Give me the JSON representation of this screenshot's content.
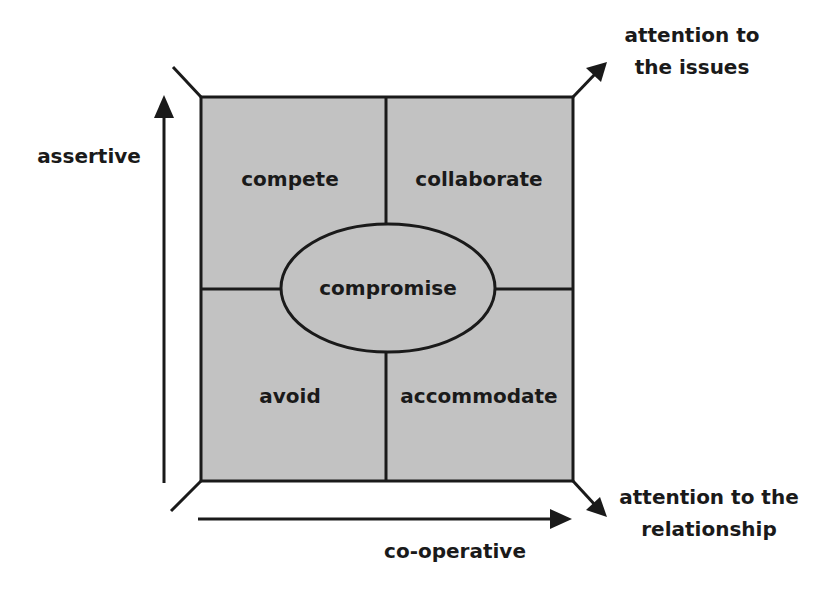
{
  "diagram": {
    "colors": {
      "box_fill": "#c2c2c2",
      "stroke": "#1a1a1a",
      "text": "#1a1a1a"
    },
    "quadrants": [
      {
        "label": "compete",
        "position": "top-left"
      },
      {
        "label": "collaborate",
        "position": "top-right"
      },
      {
        "label": "avoid",
        "position": "bottom-left"
      },
      {
        "label": "accommodate",
        "position": "bottom-right"
      }
    ],
    "center": {
      "label": "compromise"
    },
    "axes": {
      "vertical": {
        "label": "assertive"
      },
      "horizontal": {
        "label": "co-operative"
      },
      "diagonal_up": {
        "line1": "attention to",
        "line2": "the issues"
      },
      "diagonal_down": {
        "line1": "attention to the",
        "line2": "relationship"
      }
    }
  }
}
